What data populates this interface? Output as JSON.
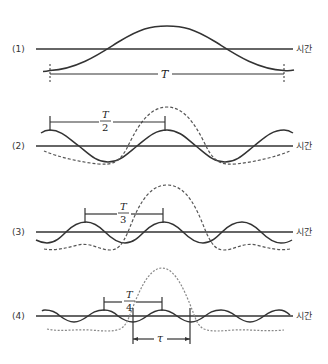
{
  "diagram": {
    "axis_label": "시간",
    "panels": [
      {
        "id": "1",
        "label": "(1)",
        "period_label": "T",
        "harmonic": 1
      },
      {
        "id": "2",
        "label": "(2)",
        "period_label_num": "T",
        "period_label_den": "2",
        "harmonic": 2
      },
      {
        "id": "3",
        "label": "(3)",
        "period_label_num": "T",
        "period_label_den": "3",
        "harmonic": 3
      },
      {
        "id": "4",
        "label": "(4)",
        "period_label_num": "T",
        "period_label_den": "4",
        "harmonic": 4,
        "width_label": "τ"
      }
    ],
    "legend": {
      "solid": "harmonic component",
      "dashed": "cumulative sum of components"
    },
    "colors": {
      "line": "#333333",
      "dashed": "#555555",
      "background": "#ffffff"
    }
  }
}
